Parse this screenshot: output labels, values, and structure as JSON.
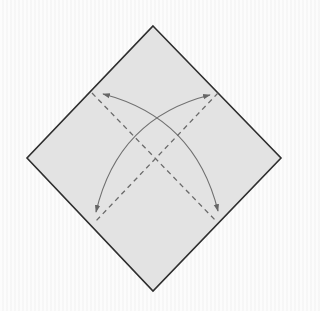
{
  "diagram": {
    "type": "origami-fold-diagram",
    "colors": {
      "paper_fill": "#e3e3e3",
      "paper_edge": "#2e2e2e",
      "fold_line": "#6a6a6a",
      "arrow": "#707070",
      "background": "#fafafa"
    },
    "paper": {
      "shape": "diamond",
      "points": [
        [
          153,
          26
        ],
        [
          281,
          158
        ],
        [
          153,
          291
        ],
        [
          27,
          158
        ]
      ]
    },
    "fold_lines": [
      {
        "style": "valley-dashed",
        "from": [
          92,
          93
        ],
        "to": [
          217,
          222
        ]
      },
      {
        "style": "valley-dashed",
        "from": [
          218,
          93
        ],
        "to": [
          95,
          222
        ]
      }
    ],
    "arrows": [
      {
        "kind": "fold-unfold",
        "from": [
          103,
          94
        ],
        "to": [
          218,
          211
        ],
        "control": [
          195,
          118
        ]
      },
      {
        "kind": "fold-unfold",
        "from": [
          210,
          95
        ],
        "to": [
          96,
          212
        ],
        "control": [
          118,
          118
        ]
      }
    ]
  }
}
